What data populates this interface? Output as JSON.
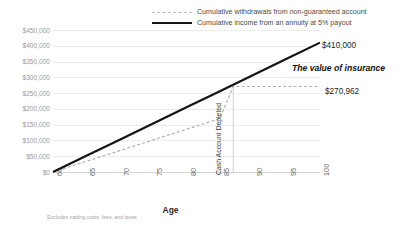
{
  "chart_data": {
    "type": "line",
    "title": "",
    "xlabel": "Age",
    "ylabel": "",
    "xlim": [
      60,
      100
    ],
    "ylim": [
      0,
      450000
    ],
    "grid": true,
    "legend_position": "top",
    "x_ticks": [
      "60",
      "65",
      "70",
      "75",
      "80",
      "85",
      "90",
      "95",
      "100"
    ],
    "y_ticks": [
      "$450,000",
      "$400,000",
      "$350,000",
      "$300,000",
      "$250,000",
      "$200,000",
      "$150,000",
      "$100,000",
      "$50,000",
      "$0"
    ],
    "series": [
      {
        "name": "Cumulative withdrawals from non-guaranteed account",
        "style": "dashed",
        "color": "#b0b0b0",
        "x": [
          60,
          65,
          70,
          75,
          80,
          85,
          87,
          90,
          95,
          100
        ],
        "values": [
          0,
          33870,
          67741,
          101611,
          135481,
          169352,
          270962,
          270962,
          270962,
          270962
        ]
      },
      {
        "name": "Cumulative income from an annuity at 5% payout",
        "style": "solid",
        "color": "#141414",
        "x": [
          60,
          65,
          70,
          75,
          80,
          85,
          87,
          90,
          95,
          100
        ],
        "values": [
          0,
          51250,
          102500,
          153750,
          205000,
          256250,
          276750,
          307500,
          358750,
          410000
        ]
      }
    ],
    "annotations": [
      {
        "name": "annuity-end-value",
        "text": "$410,000",
        "x": 100,
        "y": 410000
      },
      {
        "name": "withdrawal-end-value",
        "text": "$270,962",
        "x": 100,
        "y": 270962
      },
      {
        "name": "value-of-insurance",
        "text": "The value of insurance"
      },
      {
        "name": "cash-account-depleted",
        "text": "Cash Account Depleted",
        "x": 87
      }
    ]
  },
  "legend": {
    "items": [
      {
        "label": "Cumulative withdrawals from non-guaranteed account",
        "style": "dashed"
      },
      {
        "label": "Cumulative income from an annuity at 5% payout",
        "style": "solid"
      }
    ]
  },
  "axis": {
    "x_title": "Age"
  },
  "callouts": {
    "annuity_total": "$410,000",
    "withdrawal_total": "$270,962",
    "value_of_insurance": "The value of insurance",
    "depleted_marker": "Cash Account Depleted"
  },
  "footnote": "Excludes trading costs, fees, and taxes"
}
